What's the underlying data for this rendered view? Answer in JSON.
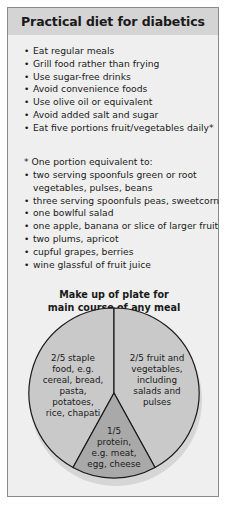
{
  "header": {
    "title": "Practical diet for diabetics"
  },
  "tips": [
    "Eat regular meals",
    "Grill food rather than frying",
    "Use sugar-free drinks",
    "Avoid convenience foods",
    "Use olive oil or equivalent",
    "Avoid added salt and sugar",
    "Eat five portions fruit/vegetables daily*"
  ],
  "portion_note": "* One portion equivalent to:",
  "portions": [
    "two serving spoonfuls green or root vegetables, pulses, beans",
    "three serving spoonfuls peas, sweetcorn",
    "one bowlful salad",
    "one apple, banana or slice of larger fruit",
    "two plums, apricot",
    "cupful grapes, berries",
    "wine glassful of fruit juice"
  ],
  "plate": {
    "title_line1": "Make up of plate for",
    "title_line2": "main course of any meal",
    "segments": [
      {
        "fraction": "2/5",
        "label_lines": [
          "2/5 staple",
          "food, e.g.",
          "cereal, bread,",
          "pasta, potatoes,",
          "rice, chapati"
        ],
        "color": "#c9c9c9"
      },
      {
        "fraction": "2/5",
        "label_lines": [
          "2/5 fruit and",
          "vegetables,",
          "including",
          "salads and",
          "pulses"
        ],
        "color": "#c9c9c9"
      },
      {
        "fraction": "1/5",
        "label_lines": [
          "1/5",
          "protein,",
          "e.g. meat,",
          "egg, cheese"
        ],
        "color": "#a9a9a9"
      }
    ]
  },
  "colors": {
    "header_bg": "#d4d4d4",
    "body_bg": "#efefef",
    "pie_light": "#c9c9c9",
    "pie_dark": "#a9a9a9",
    "outline": "#1a1a1a"
  }
}
